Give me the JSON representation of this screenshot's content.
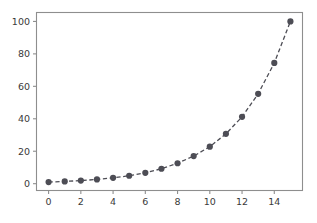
{
  "chart_data": {
    "type": "line",
    "title": "",
    "subtitle": "",
    "xlabel": "",
    "ylabel": "",
    "grid": false,
    "legend": null,
    "legend_position": "none",
    "xlim": [
      -0.75,
      15.75
    ],
    "ylim": [
      -4.2,
      105.5
    ],
    "xticks": [
      0,
      2,
      4,
      6,
      8,
      10,
      12,
      14
    ],
    "xtick_labels": [
      "0",
      "2",
      "4",
      "6",
      "8",
      "10",
      "12",
      "14"
    ],
    "yticks": [
      0,
      20,
      40,
      60,
      80,
      100
    ],
    "ytick_labels": [
      "0",
      "20",
      "40",
      "60",
      "80",
      "100"
    ],
    "series": [
      {
        "name": "series-1",
        "color": "#4d4d55",
        "linestyle": "dashed",
        "marker": "circle",
        "x": [
          0,
          1,
          2,
          3,
          4,
          5,
          6,
          7,
          8,
          9,
          10,
          11,
          12,
          13,
          14,
          15
        ],
        "values": [
          1.0,
          1.4,
          1.9,
          2.6,
          3.6,
          4.9,
          6.7,
          9.2,
          12.6,
          17.0,
          22.8,
          30.7,
          41.2,
          55.4,
          74.4,
          100.0
        ]
      }
    ]
  },
  "figure": {
    "background_color": "#ffffff",
    "axes_color": "#8e8e8e",
    "tick_label_color": "#3a3a3a",
    "series_color": "#4d4d55"
  }
}
